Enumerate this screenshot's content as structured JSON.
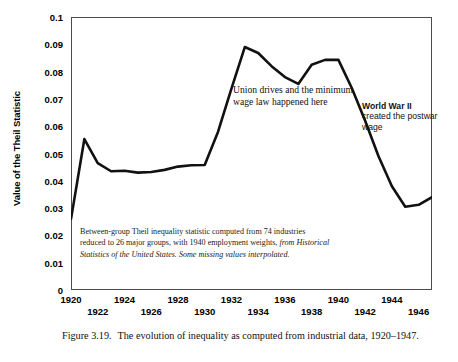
{
  "figure": {
    "caption_label": "Figure 3.19.",
    "caption_text": "The evolution of inequality as computed from industrial data, 1920–1947."
  },
  "axes": {
    "ytitle": "Value of the Theil Statistic",
    "yticks": [
      "0.1",
      "0.09",
      "0.08",
      "0.07",
      "0.06",
      "0.05",
      "0.04",
      "0.03",
      "0.02",
      "0.01",
      "0"
    ],
    "xticks": [
      "1920",
      "1922",
      "1924",
      "1926",
      "1928",
      "1930",
      "1932",
      "1934",
      "1936",
      "1938",
      "1940",
      "1942",
      "1944",
      "1946"
    ]
  },
  "annotations": {
    "union": "Union drives and the minimum wage law happened here",
    "wwii_bold": "World War II",
    "wwii_rest": "created the postwar wage"
  },
  "footnote": {
    "plain1": "Between-group Theil inequality statistic computed from 74 industries reduced to 26 major groups, with 1940 employment weights,",
    "italic1": " from Historical Statistics of the United States. Some missing values interpolated."
  },
  "chart_data": {
    "type": "line",
    "xlabel": "",
    "ylabel": "Value of the Theil Statistic",
    "xlim": [
      1920,
      1947
    ],
    "ylim": [
      0,
      0.1
    ],
    "grid": false,
    "legend": "none",
    "line_color": "#111111",
    "x": [
      1920,
      1921,
      1922,
      1923,
      1924,
      1925,
      1926,
      1927,
      1928,
      1929,
      1930,
      1931,
      1932,
      1933,
      1934,
      1935,
      1936,
      1937,
      1938,
      1939,
      1940,
      1941,
      1942,
      1943,
      1944,
      1945,
      1946,
      1947
    ],
    "values": [
      0.026,
      0.0553,
      0.0465,
      0.0435,
      0.0437,
      0.043,
      0.0432,
      0.044,
      0.0452,
      0.0457,
      0.0458,
      0.058,
      0.0738,
      0.089,
      0.0868,
      0.082,
      0.078,
      0.0755,
      0.0825,
      0.0843,
      0.0843,
      0.074,
      0.062,
      0.049,
      0.038,
      0.0305,
      0.0312,
      0.034
    ],
    "series": [
      {
        "name": "Between-group Theil statistic",
        "values": [
          0.026,
          0.0553,
          0.0465,
          0.0435,
          0.0437,
          0.043,
          0.0432,
          0.044,
          0.0452,
          0.0457,
          0.0458,
          0.058,
          0.0738,
          0.089,
          0.0868,
          0.082,
          0.078,
          0.0755,
          0.0825,
          0.0843,
          0.0843,
          0.074,
          0.062,
          0.049,
          0.038,
          0.0305,
          0.0312,
          0.034
        ]
      }
    ]
  }
}
